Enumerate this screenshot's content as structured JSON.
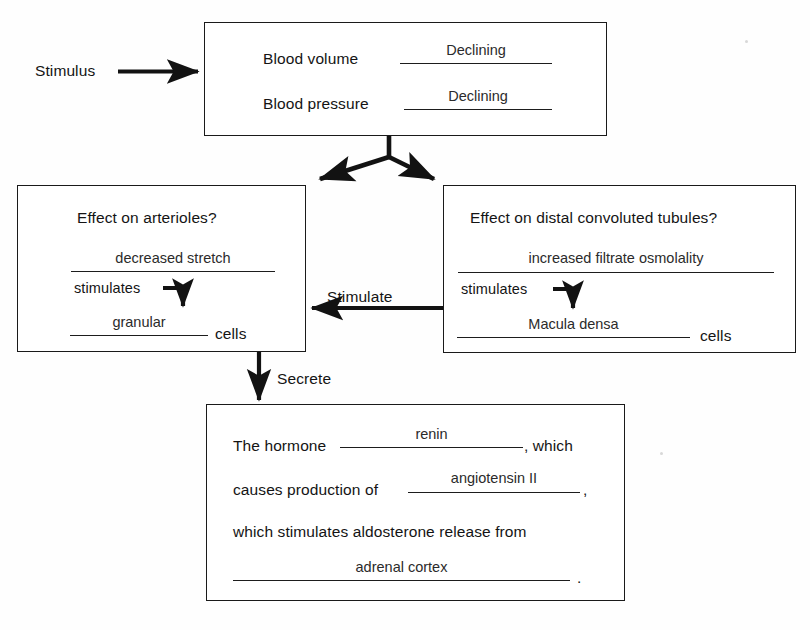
{
  "diagram": {
    "stimulus_label": "Stimulus",
    "top_box": {
      "rows": [
        {
          "label": "Blood volume",
          "answer": "Declining"
        },
        {
          "label": "Blood pressure",
          "answer": "Declining"
        }
      ]
    },
    "left_box": {
      "question": "Effect on arterioles?",
      "answer": "decreased stretch",
      "connector_label": "stimulates",
      "cell_answer": "granular",
      "cell_suffix": "cells"
    },
    "right_box": {
      "question": "Effect on distal convoluted tubules?",
      "answer": "increased filtrate osmolality",
      "connector_label": "stimulates",
      "cell_answer": "Macula densa",
      "cell_suffix": "cells"
    },
    "bottom_box": {
      "line1_prefix": "The hormone",
      "line1_answer": "renin",
      "line1_suffix": ", which",
      "line2_prefix": "causes production of",
      "line2_answer": "angiotensin II",
      "line2_suffix": ",",
      "line3": "which stimulates aldosterone release from",
      "line4_answer": "adrenal cortex",
      "line4_suffix": "."
    },
    "arrows": {
      "stimulate_label": "Stimulate",
      "secrete_label": "Secrete"
    },
    "colors": {
      "ink": "#141414",
      "rule": "#1d1d1d",
      "paper": "#fefefe"
    }
  }
}
